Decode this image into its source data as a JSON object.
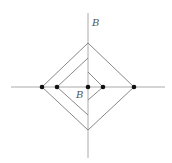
{
  "diagram": {
    "colors": {
      "axis": "#aaaaaa",
      "line": "#888888",
      "dot": "#111111",
      "label": "#555555",
      "background": "#ffffff"
    },
    "labels": {
      "outer_label": "B",
      "inner_label": "B"
    },
    "axes": {
      "horizontal": {
        "x1": 11,
        "y1": 87,
        "x2": 165,
        "y2": 87
      },
      "vertical": {
        "x1": 88,
        "y1": 13,
        "x2": 88,
        "y2": 158
      }
    },
    "dots": [
      {
        "x": 42,
        "y": 87
      },
      {
        "x": 57,
        "y": 87
      },
      {
        "x": 88,
        "y": 87
      },
      {
        "x": 103,
        "y": 87
      },
      {
        "x": 134,
        "y": 87
      }
    ],
    "shapes": {
      "outer_diamond": "88,43 134,87 88,130 42,87 88,43",
      "middle_path": "88,58 57,87 88,115",
      "inner_path": "88,72 103,87 88,100"
    }
  }
}
